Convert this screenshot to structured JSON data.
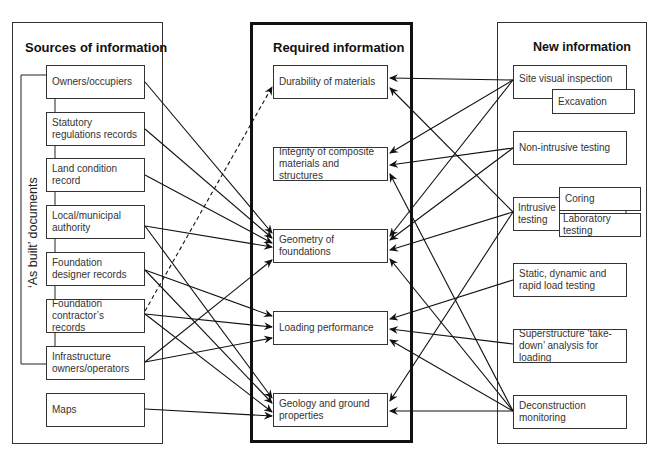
{
  "sources": {
    "title": "Sources of information",
    "as_built_label": "‘As built’ documents",
    "items": [
      {
        "id": "owners",
        "label": "Owners/occupiers"
      },
      {
        "id": "statutory",
        "label": "Statutory regulations records"
      },
      {
        "id": "land",
        "label": "Land condition record"
      },
      {
        "id": "local",
        "label": "Local/municipal authority"
      },
      {
        "id": "designer",
        "label": "Foundation designer records"
      },
      {
        "id": "contractor",
        "label": "Foundation contractor’s records"
      },
      {
        "id": "infrastructure",
        "label": "Infrastructure owners/operators"
      },
      {
        "id": "maps",
        "label": "Maps"
      }
    ]
  },
  "required": {
    "title": "Required information",
    "items": [
      {
        "id": "durability",
        "label": "Durability of materials"
      },
      {
        "id": "integrity",
        "label": "Integrity of composite materials and structures"
      },
      {
        "id": "geometry",
        "label": "Geometry of foundations"
      },
      {
        "id": "loading",
        "label": "Loading performance"
      },
      {
        "id": "geology",
        "label": "Geology and ground properties"
      }
    ]
  },
  "new_info": {
    "title": "New information",
    "items": [
      {
        "id": "site_visual",
        "label": "Site visual inspection"
      },
      {
        "id": "excavation",
        "label": "Excavation"
      },
      {
        "id": "non_intrusive",
        "label": "Non-intrusive testing"
      },
      {
        "id": "intrusive",
        "label": "Intrusive testing"
      },
      {
        "id": "coring",
        "label": "Coring"
      },
      {
        "id": "laboratory",
        "label": "Laboratory testing"
      },
      {
        "id": "static_dynamic",
        "label": "Static, dynamic and rapid load testing"
      },
      {
        "id": "superstructure",
        "label": "Superstructure ‘take-down’ analysis for loading"
      },
      {
        "id": "deconstruction",
        "label": "Deconstruction monitoring"
      }
    ]
  },
  "connections": {
    "sources_to_required": [
      {
        "from": "owners",
        "to": "geometry",
        "style": "solid"
      },
      {
        "from": "statutory",
        "to": "geometry",
        "style": "solid"
      },
      {
        "from": "land",
        "to": "geometry",
        "style": "solid"
      },
      {
        "from": "local",
        "to": "geometry",
        "style": "solid"
      },
      {
        "from": "local",
        "to": "geology",
        "style": "solid"
      },
      {
        "from": "designer",
        "to": "loading",
        "style": "solid"
      },
      {
        "from": "designer",
        "to": "geology",
        "style": "solid"
      },
      {
        "from": "contractor",
        "to": "durability",
        "style": "dashed"
      },
      {
        "from": "contractor",
        "to": "loading",
        "style": "solid"
      },
      {
        "from": "contractor",
        "to": "geology",
        "style": "solid"
      },
      {
        "from": "infrastructure",
        "to": "geometry",
        "style": "solid"
      },
      {
        "from": "infrastructure",
        "to": "loading",
        "style": "solid"
      },
      {
        "from": "maps",
        "to": "geology",
        "style": "solid"
      }
    ],
    "new_to_required": [
      {
        "from": "site_visual",
        "to": "durability"
      },
      {
        "from": "site_visual",
        "to": "integrity"
      },
      {
        "from": "site_visual",
        "to": "geometry"
      },
      {
        "from": "non_intrusive",
        "to": "integrity"
      },
      {
        "from": "non_intrusive",
        "to": "geometry"
      },
      {
        "from": "intrusive",
        "to": "durability"
      },
      {
        "from": "intrusive",
        "to": "geometry"
      },
      {
        "from": "intrusive",
        "to": "geology"
      },
      {
        "from": "static_dynamic",
        "to": "loading"
      },
      {
        "from": "superstructure",
        "to": "loading"
      },
      {
        "from": "deconstruction",
        "to": "integrity"
      },
      {
        "from": "deconstruction",
        "to": "geometry"
      },
      {
        "from": "deconstruction",
        "to": "loading"
      },
      {
        "from": "deconstruction",
        "to": "geology"
      }
    ]
  }
}
